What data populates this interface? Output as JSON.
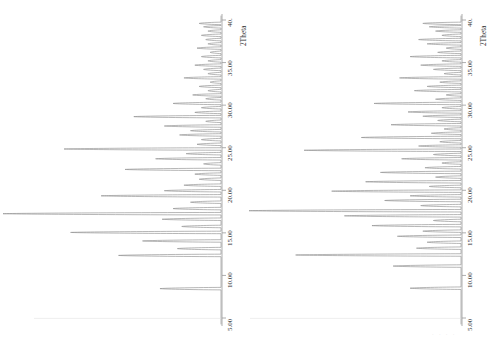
{
  "figure": {
    "title": "",
    "background_color": "#ffffff",
    "trace_color": "#8a8a8a",
    "axis_color": "#9a9a9a",
    "text_color": "#303030",
    "panel_count": 2
  },
  "chart_data": [
    {
      "type": "line",
      "title": "",
      "subtitle": "",
      "panel": "left",
      "orientation": "rotated-90ccw",
      "xlabel": "2Theta",
      "ylabel": "",
      "xlim": [
        5.0,
        40.0
      ],
      "ylim": [
        0,
        100
      ],
      "grid": false,
      "legend": [],
      "axis_ticks": [
        "5.00",
        "10.00",
        "15.00",
        "20.00",
        "25.00",
        "30.00",
        "35.00",
        "40."
      ],
      "axis_tick_values": [
        5.0,
        10.0,
        15.0,
        20.0,
        25.0,
        30.0,
        35.0,
        40.0
      ],
      "axis_title": "2Theta",
      "peaks_x": [
        8.45,
        12.35,
        13.15,
        14.05,
        15.05,
        15.75,
        16.6,
        17.25,
        17.85,
        18.6,
        19.35,
        19.95,
        20.6,
        21.3,
        21.9,
        22.45,
        23.1,
        23.7,
        24.3,
        24.85,
        25.4,
        25.95,
        26.5,
        27.0,
        27.55,
        28.1,
        28.65,
        29.15,
        29.7,
        30.2,
        30.75,
        31.2,
        31.7,
        32.2,
        32.7,
        33.2,
        33.7,
        34.2,
        34.7,
        35.2,
        35.7,
        36.2,
        36.7,
        37.2,
        37.7,
        38.2,
        38.7,
        39.2,
        39.6
      ],
      "peaks_intensity": [
        28,
        47,
        20,
        36,
        69,
        18,
        27,
        100,
        22,
        14,
        55,
        26,
        17,
        10,
        12,
        44,
        8,
        30,
        16,
        72,
        11,
        9,
        19,
        14,
        26,
        7,
        40,
        12,
        9,
        22,
        7,
        13,
        6,
        10,
        5,
        17,
        6,
        8,
        12,
        6,
        9,
        5,
        11,
        6,
        7,
        9,
        6,
        8,
        10
      ],
      "baseline_intensity": 0
    },
    {
      "type": "line",
      "title": "",
      "subtitle": "",
      "panel": "right",
      "orientation": "rotated-90ccw",
      "xlabel": "2Theta",
      "ylabel": "",
      "xlim": [
        5.0,
        40.0
      ],
      "ylim": [
        0,
        100
      ],
      "grid": false,
      "legend": [],
      "axis_ticks": [
        "5.00",
        "10.00",
        "15.00",
        "20.00",
        "25.00",
        "30.00",
        "35.00",
        "40."
      ],
      "axis_tick_values": [
        5.0,
        10.0,
        15.0,
        20.0,
        25.0,
        30.0,
        35.0,
        40.0
      ],
      "axis_title": "2Theta",
      "peaks_x": [
        8.5,
        11.1,
        12.4,
        13.2,
        13.9,
        14.6,
        15.2,
        15.85,
        16.45,
        17.0,
        17.6,
        18.2,
        18.8,
        19.35,
        19.9,
        20.45,
        21.0,
        21.55,
        22.1,
        22.65,
        23.2,
        23.7,
        24.2,
        24.7,
        25.2,
        25.7,
        26.2,
        26.7,
        27.2,
        27.7,
        28.2,
        28.7,
        29.2,
        29.7,
        30.2,
        30.7,
        31.2,
        31.7,
        32.2,
        32.7,
        33.2,
        33.7,
        34.2,
        34.7,
        35.2,
        35.7,
        36.2,
        36.7,
        37.2,
        37.7,
        38.2,
        38.7,
        39.2,
        39.6
      ],
      "peaks_intensity": [
        24,
        32,
        78,
        21,
        16,
        30,
        18,
        42,
        13,
        55,
        100,
        19,
        36,
        24,
        61,
        15,
        45,
        12,
        38,
        17,
        9,
        28,
        13,
        74,
        20,
        10,
        47,
        14,
        8,
        33,
        11,
        18,
        25,
        9,
        41,
        12,
        7,
        22,
        16,
        10,
        29,
        8,
        13,
        19,
        9,
        24,
        11,
        7,
        16,
        20,
        9,
        12,
        15,
        18
      ],
      "baseline_intensity": 0
    }
  ],
  "panels": {
    "left": {
      "name": "xrd-pattern-left",
      "axis_title": "2Theta",
      "tick_labels": [
        "5.00",
        "10.00",
        "15.00",
        "20.00",
        "25.00",
        "30.00",
        "35.00",
        "40."
      ]
    },
    "right": {
      "name": "xrd-pattern-right",
      "axis_title": "2Theta",
      "tick_labels": [
        "5.00",
        "10.00",
        "15.00",
        "20.00",
        "25.00",
        "30.00",
        "35.00",
        "40."
      ]
    }
  }
}
